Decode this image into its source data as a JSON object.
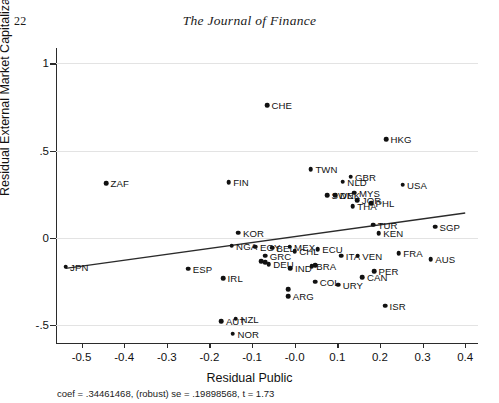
{
  "page": {
    "folio": "22",
    "journal_title": "The Journal of Finance"
  },
  "chart_data": {
    "type": "scatter",
    "title": "",
    "xlabel": "Residual Public",
    "ylabel": "Residual External Market Capitalization / GDP",
    "xlim": [
      -0.56,
      0.43
    ],
    "ylim": [
      -0.58,
      1.06
    ],
    "xticks": [
      "-0.5",
      "-0.4",
      "-0.3",
      "-0.2",
      "-0.1",
      "-0.0",
      "0.1",
      "0.2",
      "0.3",
      "0.4"
    ],
    "xtick_values": [
      -0.5,
      -0.4,
      -0.3,
      -0.2,
      -0.1,
      0.0,
      0.1,
      0.2,
      0.3,
      0.4
    ],
    "yticks": [
      "1",
      ".5",
      "0",
      "-.5"
    ],
    "ytick_values": [
      1,
      0.5,
      0,
      -0.5
    ],
    "grid": true,
    "legend": "none",
    "annotation": "coef = .34461468, (robust) se = .19898568, t = 1.73",
    "fit": {
      "type": "linear",
      "coef": 0.34461468,
      "robust_se": 0.19898568,
      "t": 1.73,
      "x_start": -0.5375,
      "y_start": -0.175,
      "x_end": 0.4,
      "y_end": 0.1425
    },
    "point_color": "#111111",
    "points": [
      {
        "label": "JPN",
        "x": -0.5375,
        "y": -0.166,
        "lpos": "right"
      },
      {
        "label": "ZAF",
        "x": -0.4425,
        "y": 0.313,
        "lpos": "right"
      },
      {
        "label": "FIN",
        "x": -0.155,
        "y": 0.32,
        "lpos": "right"
      },
      {
        "label": "CHE",
        "x": -0.065,
        "y": 0.761,
        "lpos": "right"
      },
      {
        "label": "TWN",
        "x": 0.038,
        "y": 0.394,
        "lpos": "right"
      },
      {
        "label": "GBR",
        "x": 0.131,
        "y": 0.351,
        "lpos": "right"
      },
      {
        "label": "NLD",
        "x": 0.113,
        "y": 0.323,
        "lpos": "right"
      },
      {
        "label": "SWE",
        "x": 0.076,
        "y": 0.245,
        "lpos": "right"
      },
      {
        "label": "DNK",
        "x": 0.095,
        "y": 0.245,
        "lpos": "right"
      },
      {
        "label": "HKG",
        "x": 0.214,
        "y": 0.565,
        "lpos": "right"
      },
      {
        "label": "USA",
        "x": 0.253,
        "y": 0.305,
        "lpos": "right"
      },
      {
        "label": "MYS",
        "x": 0.14,
        "y": 0.26,
        "lpos": "right"
      },
      {
        "label": "JOR",
        "x": 0.147,
        "y": 0.215,
        "lpos": "right"
      },
      {
        "label": "THA",
        "x": 0.136,
        "y": 0.181,
        "lpos": "right"
      },
      {
        "label": "PHL",
        "x": 0.179,
        "y": 0.199,
        "lpos": "right"
      },
      {
        "label": "SGP",
        "x": 0.329,
        "y": 0.065,
        "lpos": "right"
      },
      {
        "label": "TUR",
        "x": 0.184,
        "y": 0.075,
        "lpos": "right"
      },
      {
        "label": "KEN",
        "x": 0.197,
        "y": 0.026,
        "lpos": "right"
      },
      {
        "label": "KOR",
        "x": -0.132,
        "y": 0.029,
        "lpos": "right"
      },
      {
        "label": "NGA",
        "x": -0.148,
        "y": -0.044,
        "lpos": "right"
      },
      {
        "label": "EGY",
        "x": -0.092,
        "y": -0.05,
        "lpos": "right"
      },
      {
        "label": "BEL",
        "x": -0.053,
        "y": -0.056,
        "lpos": "right"
      },
      {
        "label": "MEX",
        "x": -0.012,
        "y": -0.05,
        "lpos": "right"
      },
      {
        "label": "CHL",
        "x": 0.0,
        "y": -0.077,
        "lpos": "right"
      },
      {
        "label": "GRC",
        "x": -0.069,
        "y": -0.103,
        "lpos": "right"
      },
      {
        "label": "USA2",
        "x": -0.079,
        "y": -0.134,
        "lpos": "none"
      },
      {
        "label": "AUS2",
        "x": -0.069,
        "y": -0.14,
        "lpos": "none"
      },
      {
        "label": "DEU",
        "x": -0.061,
        "y": -0.152,
        "lpos": "right"
      },
      {
        "label": "ESP",
        "x": -0.25,
        "y": -0.177,
        "lpos": "right"
      },
      {
        "label": "IRL",
        "x": -0.168,
        "y": -0.232,
        "lpos": "right"
      },
      {
        "label": "ECU",
        "x": 0.054,
        "y": -0.065,
        "lpos": "right"
      },
      {
        "label": "ITA",
        "x": 0.109,
        "y": -0.103,
        "lpos": "right"
      },
      {
        "label": "VEN",
        "x": 0.148,
        "y": -0.103,
        "lpos": "right"
      },
      {
        "label": "IND",
        "x": -0.01,
        "y": -0.174,
        "lpos": "right"
      },
      {
        "label": "BRA",
        "x": 0.04,
        "y": -0.162,
        "lpos": "right"
      },
      {
        "label": "PAK",
        "x": 0.048,
        "y": -0.156,
        "lpos": "none"
      },
      {
        "label": "COL",
        "x": 0.048,
        "y": -0.251,
        "lpos": "right"
      },
      {
        "label": "URY",
        "x": 0.102,
        "y": -0.268,
        "lpos": "right"
      },
      {
        "label": "DNK2",
        "x": -0.015,
        "y": -0.294,
        "lpos": "none"
      },
      {
        "label": "ARG",
        "x": -0.015,
        "y": -0.335,
        "lpos": "right"
      },
      {
        "label": "ISR",
        "x": 0.212,
        "y": -0.39,
        "lpos": "right"
      },
      {
        "label": "FRA",
        "x": 0.244,
        "y": -0.087,
        "lpos": "right"
      },
      {
        "label": "AUS",
        "x": 0.319,
        "y": -0.122,
        "lpos": "right"
      },
      {
        "label": "PER",
        "x": 0.186,
        "y": -0.19,
        "lpos": "right"
      },
      {
        "label": "CAN",
        "x": 0.159,
        "y": -0.224,
        "lpos": "right"
      },
      {
        "label": "AUT",
        "x": -0.172,
        "y": -0.477,
        "lpos": "right"
      },
      {
        "label": "NZL",
        "x": -0.138,
        "y": -0.463,
        "lpos": "right"
      },
      {
        "label": "NOR",
        "x": -0.145,
        "y": -0.55,
        "lpos": "right"
      }
    ]
  }
}
